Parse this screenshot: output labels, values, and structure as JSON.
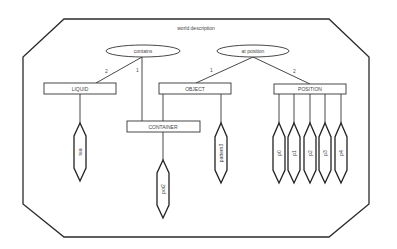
{
  "diagram": {
    "title": "world description",
    "relations": [
      {
        "id": "contains",
        "label": "contains"
      },
      {
        "id": "at_position",
        "label": "at position"
      }
    ],
    "types": [
      {
        "id": "liquid",
        "label": "LIQUID"
      },
      {
        "id": "object",
        "label": "OBJECT"
      },
      {
        "id": "position",
        "label": "POSITION"
      },
      {
        "id": "container",
        "label": "CONTAINER"
      }
    ],
    "instances": [
      {
        "id": "tea",
        "label": "tea"
      },
      {
        "id": "pot2",
        "label": "pot2"
      },
      {
        "id": "pattern3",
        "label": "pattern3"
      },
      {
        "id": "p0",
        "label": "p0"
      },
      {
        "id": "p1",
        "label": "p1"
      },
      {
        "id": "p2",
        "label": "p2"
      },
      {
        "id": "p3",
        "label": "p3"
      },
      {
        "id": "p4",
        "label": "p4"
      }
    ],
    "edge_labels": {
      "contains_liquid": "2",
      "contains_container": "1",
      "at_position_object": "1",
      "at_position_position": "2"
    }
  }
}
